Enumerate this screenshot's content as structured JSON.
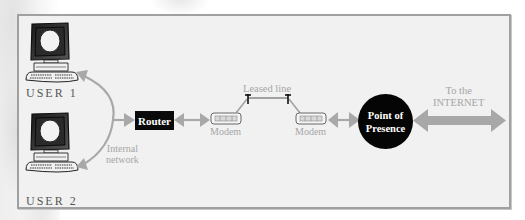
{
  "diagram": {
    "type": "network-topology",
    "nodes": {
      "user1": {
        "label": "USER 1",
        "icon": "desktop-computer-icon"
      },
      "user2": {
        "label": "USER 2",
        "icon": "desktop-computer-icon"
      },
      "router": {
        "label": "Router"
      },
      "modem_left": {
        "label": "Modem",
        "icon": "modem-icon"
      },
      "modem_right": {
        "label": "Modem",
        "icon": "modem-icon"
      },
      "pop": {
        "line1": "Point of",
        "line2": "Presence"
      }
    },
    "labels": {
      "internal_network_line1": "Internal",
      "internal_network_line2": "network",
      "leased_line": "Leased line",
      "internet_line1": "To the",
      "internet_line2": "INTERNET"
    },
    "connections": [
      {
        "from": "USER 1",
        "to": "Router",
        "via": "Internal network"
      },
      {
        "from": "USER 2",
        "to": "Router",
        "via": "Internal network"
      },
      {
        "from": "Router",
        "to": "Modem"
      },
      {
        "from": "Modem",
        "to": "Modem",
        "via": "Leased line"
      },
      {
        "from": "Modem",
        "to": "Point of Presence"
      },
      {
        "from": "Point of Presence",
        "to": "INTERNET"
      }
    ],
    "colors": {
      "frame_bg": "#f1f1f1",
      "frame_border": "#a0a0a0",
      "arrow": "#a8a8a8",
      "node_fill": "#0a0a0a",
      "label_gray": "#a6a6a6"
    }
  }
}
